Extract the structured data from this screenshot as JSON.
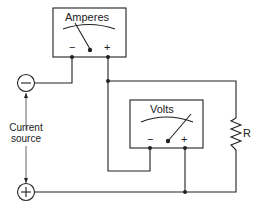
{
  "diagram": {
    "type": "circuit",
    "ammeter": {
      "label": "Amperes",
      "minus": "−",
      "plus": "+"
    },
    "voltmeter": {
      "label": "Volts",
      "minus": "−",
      "plus": "+"
    },
    "source": {
      "label_line1": "Current",
      "label_line2": "source",
      "minus_symbol": "−",
      "plus_symbol": "+"
    },
    "resistor": {
      "label": "R"
    }
  },
  "colors": {
    "line": "#222222",
    "background": "#ffffff"
  }
}
